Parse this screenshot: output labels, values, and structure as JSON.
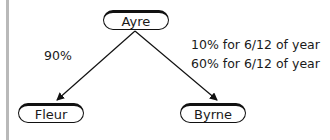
{
  "nodes": {
    "top": {
      "label": "Ayre"
    },
    "left": {
      "label": "Fleur"
    },
    "right": {
      "label": "Byrne"
    }
  },
  "edges": {
    "left": {
      "label": "90%"
    },
    "right": {
      "labels": [
        "10% for 6/12 of year",
        "60% for 6/12 of year"
      ]
    }
  }
}
